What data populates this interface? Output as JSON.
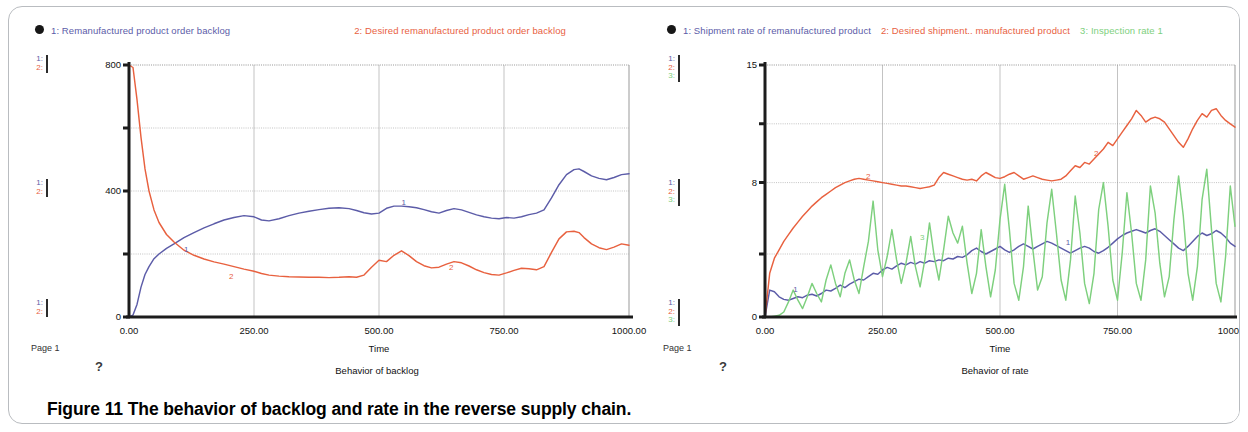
{
  "figure": {
    "caption": "Figure 11 The behavior of backlog and rate in the reverse supply chain."
  },
  "colors": {
    "series1": "#5c5ca8",
    "series2": "#e8613f",
    "series3": "#7ed07e",
    "axis": "#1c1c1c",
    "grid": "#9a9a9a",
    "frame": "#b9bcc0"
  },
  "panels": [
    {
      "id": "backlog",
      "page_label": "Page 1",
      "help_glyph": "?",
      "legend_marker": "filled-circle-marker",
      "legend": [
        {
          "index": "1:",
          "label": "1: Remanufactured  product order backlog",
          "color_key": "series1"
        },
        {
          "index": "2:",
          "label": "2: Desired remanufactured  product order backlog",
          "color_key": "series2"
        }
      ],
      "rails": [
        {
          "rows": [
            "1:",
            "2:"
          ]
        },
        {
          "rows": [
            "1:",
            "2:"
          ]
        },
        {
          "rows": [
            "1:",
            "2:"
          ]
        }
      ],
      "chart_data": {
        "type": "line",
        "title": "",
        "caption": "Behavior of backlog",
        "xlabel": "Time",
        "ylabel": "",
        "grid": true,
        "legend_position": "top",
        "xlim": [
          0,
          1000
        ],
        "ylim": [
          0,
          800
        ],
        "xticks": [
          0,
          250,
          500,
          750,
          1000
        ],
        "xticklabels": [
          "0.00",
          "250.00",
          "500.00",
          "750.00",
          "1000.00"
        ],
        "yticks": [
          0,
          200,
          400,
          600,
          800
        ],
        "yticklabels": [
          "0",
          "",
          "400",
          "",
          "800"
        ],
        "inplot_labels": [
          {
            "text": "1",
            "x": 110,
            "y": 205,
            "color_key": "series1"
          },
          {
            "text": "2",
            "x": 200,
            "y": 120,
            "color_key": "series2"
          },
          {
            "text": "1",
            "x": 545,
            "y": 355,
            "color_key": "series1"
          },
          {
            "text": "2",
            "x": 640,
            "y": 150,
            "color_key": "series2"
          }
        ],
        "x": [
          0,
          8,
          16,
          24,
          32,
          40,
          50,
          60,
          75,
          90,
          110,
          130,
          150,
          170,
          190,
          210,
          230,
          250,
          265,
          280,
          300,
          320,
          340,
          360,
          380,
          400,
          420,
          440,
          455,
          470,
          485,
          500,
          515,
          530,
          545,
          560,
          575,
          590,
          605,
          620,
          635,
          650,
          665,
          680,
          695,
          710,
          725,
          740,
          755,
          770,
          785,
          800,
          815,
          830,
          845,
          860,
          875,
          890,
          900,
          910,
          925,
          940,
          955,
          970,
          985,
          1000
        ],
        "series": [
          {
            "name": "Remanufactured product order backlog",
            "key": "series1",
            "values": [
              0,
              6,
              40,
              95,
              135,
              160,
              185,
              200,
              218,
              232,
              252,
              268,
              283,
              296,
              308,
              316,
              322,
              318,
              308,
              305,
              312,
              322,
              330,
              336,
              341,
              345,
              347,
              344,
              338,
              331,
              327,
              330,
              345,
              352,
              352,
              350,
              347,
              341,
              334,
              330,
              338,
              344,
              340,
              332,
              324,
              318,
              314,
              312,
              316,
              314,
              318,
              325,
              330,
              340,
              378,
              420,
              452,
              468,
              470,
              462,
              448,
              440,
              436,
              443,
              452,
              455
            ]
          },
          {
            "name": "Desired remanufactured product order backlog",
            "key": "series2",
            "values": [
              800,
              792,
              690,
              570,
              470,
              400,
              340,
              300,
              262,
              238,
              212,
              196,
              184,
              175,
              168,
              160,
              152,
              145,
              138,
              133,
              130,
              128,
              127,
              126,
              126,
              125,
              126,
              128,
              126,
              133,
              158,
              180,
              176,
              196,
              210,
              195,
              176,
              163,
              156,
              158,
              168,
              176,
              172,
              162,
              150,
              141,
              135,
              133,
              140,
              148,
              155,
              153,
              150,
              160,
              205,
              248,
              270,
              272,
              268,
              252,
              232,
              220,
              214,
              222,
              232,
              228
            ]
          }
        ]
      }
    },
    {
      "id": "rate",
      "page_label": "Page 1",
      "help_glyph": "?",
      "legend_marker": "filled-circle-marker",
      "legend": [
        {
          "index": "1:",
          "label": "1: Shipment rate of remanufactured product",
          "color_key": "series1"
        },
        {
          "index": "2:",
          "label": "2: Desired shipment.. manufactured product",
          "color_key": "series2"
        },
        {
          "index": "3:",
          "label": "3: Inspection  rate 1",
          "color_key": "series3"
        }
      ],
      "rails": [
        {
          "rows": [
            "1:",
            "2:",
            "3:"
          ]
        },
        {
          "rows": [
            "1:",
            "2:",
            "3:"
          ]
        },
        {
          "rows": [
            "1:",
            "2:",
            "3:"
          ]
        }
      ],
      "chart_data": {
        "type": "line",
        "title": "",
        "caption": "Behavior of rate",
        "xlabel": "Time",
        "ylabel": "",
        "grid": true,
        "legend_position": "top",
        "xlim": [
          0,
          1000
        ],
        "ylim": [
          0,
          15
        ],
        "xticks": [
          0,
          250,
          500,
          750,
          1000
        ],
        "xticklabels": [
          "0.00",
          "250.00",
          "500.00",
          "750.00",
          "1000.00"
        ],
        "yticks": [
          0,
          3.75,
          8,
          11.5,
          15
        ],
        "yticklabels": [
          "0",
          "",
          "8",
          "",
          "15"
        ],
        "inplot_labels": [
          {
            "text": "1",
            "x": 60,
            "y": 1.5,
            "color_key": "series1"
          },
          {
            "text": "2",
            "x": 215,
            "y": 8.2,
            "color_key": "series2"
          },
          {
            "text": "3",
            "x": 330,
            "y": 4.6,
            "color_key": "series3"
          },
          {
            "text": "2",
            "x": 700,
            "y": 9.6,
            "color_key": "series2"
          },
          {
            "text": "1",
            "x": 640,
            "y": 4.3,
            "color_key": "series1"
          }
        ],
        "x": [
          0,
          10,
          20,
          30,
          40,
          50,
          60,
          70,
          80,
          90,
          100,
          110,
          120,
          130,
          140,
          150,
          160,
          170,
          180,
          190,
          200,
          210,
          220,
          230,
          240,
          250,
          260,
          270,
          280,
          290,
          300,
          310,
          320,
          330,
          340,
          350,
          360,
          370,
          380,
          390,
          400,
          410,
          420,
          430,
          440,
          450,
          460,
          470,
          480,
          490,
          500,
          510,
          520,
          530,
          540,
          550,
          560,
          570,
          580,
          590,
          600,
          610,
          620,
          630,
          640,
          650,
          660,
          670,
          680,
          690,
          700,
          710,
          720,
          730,
          740,
          750,
          760,
          770,
          780,
          790,
          800,
          810,
          820,
          830,
          840,
          850,
          860,
          870,
          880,
          890,
          900,
          910,
          920,
          930,
          940,
          950,
          960,
          970,
          980,
          990,
          1000
        ],
        "series": [
          {
            "name": "Shipment rate of remanufactured product",
            "key": "series1",
            "values": [
              0,
              1.6,
              1.5,
              1.2,
              1.05,
              1.0,
              1.1,
              1.2,
              1.15,
              1.3,
              1.35,
              1.25,
              1.4,
              1.6,
              1.55,
              1.7,
              1.9,
              1.75,
              1.95,
              2.1,
              2.25,
              2.2,
              2.4,
              2.6,
              2.55,
              2.8,
              2.95,
              2.85,
              3.05,
              3.2,
              3.1,
              3.25,
              3.15,
              3.3,
              3.2,
              3.35,
              3.3,
              3.4,
              3.35,
              3.5,
              3.45,
              3.6,
              3.55,
              3.7,
              3.95,
              4.1,
              3.9,
              3.75,
              3.9,
              4.05,
              4.2,
              4.0,
              3.85,
              4.0,
              4.2,
              4.35,
              4.2,
              4.05,
              4.2,
              4.35,
              4.5,
              4.4,
              4.25,
              4.1,
              3.95,
              3.8,
              3.95,
              4.1,
              4.2,
              4.1,
              3.9,
              3.8,
              3.95,
              4.15,
              4.4,
              4.65,
              4.85,
              5.0,
              5.1,
              5.2,
              5.1,
              5.0,
              5.15,
              5.25,
              5.1,
              4.85,
              4.6,
              4.35,
              4.1,
              3.95,
              4.2,
              4.5,
              4.8,
              5.0,
              4.85,
              4.95,
              5.15,
              5.0,
              4.75,
              4.4,
              4.2
            ]
          },
          {
            "name": "Desired shipment of remanufactured product",
            "key": "series2",
            "values": [
              0,
              2.6,
              3.5,
              4.0,
              4.5,
              4.9,
              5.3,
              5.65,
              6.0,
              6.3,
              6.6,
              6.85,
              7.1,
              7.3,
              7.5,
              7.7,
              7.85,
              8.0,
              8.1,
              8.2,
              8.25,
              8.2,
              8.15,
              8.1,
              8.05,
              8.0,
              7.95,
              7.9,
              7.85,
              7.8,
              7.8,
              7.75,
              7.7,
              7.65,
              7.7,
              7.75,
              7.85,
              8.3,
              8.6,
              8.5,
              8.4,
              8.3,
              8.2,
              8.15,
              8.2,
              8.1,
              8.4,
              8.6,
              8.45,
              8.3,
              8.25,
              8.35,
              8.5,
              8.6,
              8.4,
              8.2,
              8.3,
              8.4,
              8.3,
              8.2,
              8.15,
              8.1,
              8.15,
              8.2,
              8.4,
              8.7,
              9.0,
              8.9,
              9.2,
              9.1,
              9.4,
              9.7,
              10.0,
              10.4,
              10.2,
              10.6,
              11.0,
              11.4,
              11.8,
              12.3,
              12.0,
              11.6,
              11.8,
              11.9,
              11.8,
              11.6,
              11.2,
              10.8,
              10.4,
              10.1,
              10.6,
              11.2,
              11.7,
              12.1,
              11.9,
              12.3,
              12.4,
              12.0,
              11.7,
              11.5,
              11.3
            ]
          },
          {
            "name": "Inspection rate 1",
            "key": "series3",
            "values": [
              0,
              0,
              0.05,
              0.1,
              0.3,
              0.9,
              1.6,
              1.0,
              0.5,
              1.2,
              2.0,
              1.4,
              0.9,
              2.2,
              3.1,
              2.0,
              1.2,
              2.6,
              3.4,
              2.2,
              1.4,
              3.0,
              4.5,
              6.9,
              4.0,
              2.4,
              3.6,
              5.2,
              3.4,
              2.0,
              3.2,
              4.8,
              3.0,
              1.8,
              3.4,
              5.6,
              3.6,
              2.2,
              4.0,
              6.0,
              5.0,
              4.4,
              5.4,
              3.2,
              1.4,
              2.6,
              5.2,
              3.0,
              1.2,
              2.8,
              5.8,
              7.9,
              5.2,
              2.0,
              1.0,
              3.0,
              6.6,
              4.0,
              1.6,
              2.4,
              5.6,
              7.6,
              5.0,
              2.2,
              1.0,
              3.4,
              7.2,
              5.0,
              2.0,
              0.8,
              2.6,
              6.4,
              8.0,
              5.4,
              2.2,
              1.0,
              3.8,
              7.4,
              5.0,
              2.0,
              1.0,
              3.4,
              7.8,
              6.2,
              3.2,
              1.2,
              2.4,
              5.8,
              8.4,
              6.0,
              2.6,
              1.0,
              3.0,
              7.0,
              8.8,
              5.2,
              2.0,
              0.9,
              3.6,
              7.8,
              5.4
            ]
          }
        ]
      }
    }
  ]
}
